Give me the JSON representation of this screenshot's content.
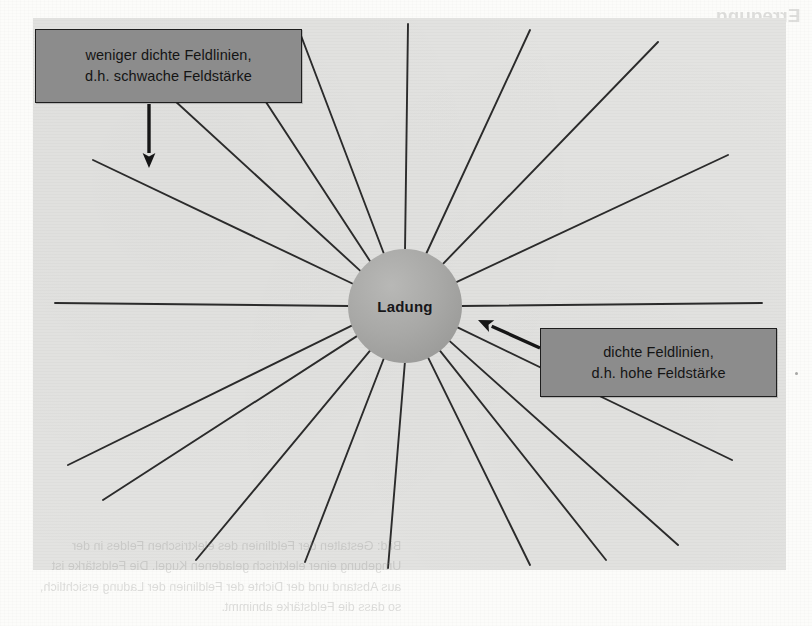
{
  "figure": {
    "charge_label": "Ladung",
    "panel": {
      "fill": "#e3e3e1",
      "x": 33,
      "y": 18,
      "width": 753,
      "height": 552
    },
    "charge_circle": {
      "cx": 405,
      "cy": 306,
      "r": 57,
      "fill": "#a9a9a7"
    },
    "line_color": "#2b2b2b",
    "annotations": [
      {
        "name": "weak-field-callout",
        "line1": "weniger dichte Feldlinien,",
        "line2": "d.h. schwache Feldstärke",
        "box": {
          "x": 35,
          "y": 29,
          "width": 267,
          "height": 74
        },
        "fill": "#8c8c8c",
        "arrow": {
          "x1": 149,
          "y1": 104,
          "x2": 149,
          "y2": 168
        }
      },
      {
        "name": "strong-field-callout",
        "line1": "dichte Feldlinien,",
        "line2": "d.h. hohe Feldstärke",
        "box": {
          "x": 540,
          "y": 328,
          "width": 237,
          "height": 69
        },
        "fill": "#8c8c8c",
        "arrow": {
          "x1": 540,
          "y1": 348,
          "x2": 478,
          "y2": 320
        }
      }
    ],
    "field_lines": [
      {
        "angle_deg": 180,
        "outer_x": 55,
        "outer_y": 303
      },
      {
        "angle_deg": 203,
        "outer_x": 93,
        "outer_y": 160
      },
      {
        "angle_deg": 218,
        "outer_x": 150,
        "outer_y": 78
      },
      {
        "angle_deg": 232,
        "outer_x": 228,
        "outer_y": 44
      },
      {
        "angle_deg": 248,
        "outer_x": 300,
        "outer_y": 33
      },
      {
        "angle_deg": 270,
        "outer_x": 408,
        "outer_y": 24
      },
      {
        "angle_deg": 292,
        "outer_x": 530,
        "outer_y": 30
      },
      {
        "angle_deg": 312,
        "outer_x": 658,
        "outer_y": 42
      },
      {
        "angle_deg": 335,
        "outer_x": 728,
        "outer_y": 155
      },
      {
        "angle_deg": 0,
        "outer_x": 762,
        "outer_y": 303
      },
      {
        "angle_deg": 22,
        "outer_x": 732,
        "outer_y": 460
      },
      {
        "angle_deg": 38,
        "outer_x": 678,
        "outer_y": 545
      },
      {
        "angle_deg": 52,
        "outer_x": 606,
        "outer_y": 560
      },
      {
        "angle_deg": 66,
        "outer_x": 530,
        "outer_y": 565
      },
      {
        "angle_deg": 90,
        "outer_x": 388,
        "outer_y": 568
      },
      {
        "angle_deg": 112,
        "outer_x": 305,
        "outer_y": 562
      },
      {
        "angle_deg": 128,
        "outer_x": 196,
        "outer_y": 560
      },
      {
        "angle_deg": 148,
        "outer_x": 103,
        "outer_y": 500
      },
      {
        "angle_deg": 160,
        "outer_x": 68,
        "outer_y": 465
      }
    ]
  },
  "bleed_through": {
    "heading_line1": "Erregung",
    "heading_line2": "(Bild)",
    "caption_rows": [
      "Bild: Gestalten der Feldlinien des elektrischen Feldes in der",
      "Umgebung einer elektrisch geladenen Kugel. Die Feldstärke ist",
      "aus Abstand und der Dichte der Feldlinien der Ladung ersichtlich,",
      "so dass die Feldstärke abnimmt."
    ]
  }
}
